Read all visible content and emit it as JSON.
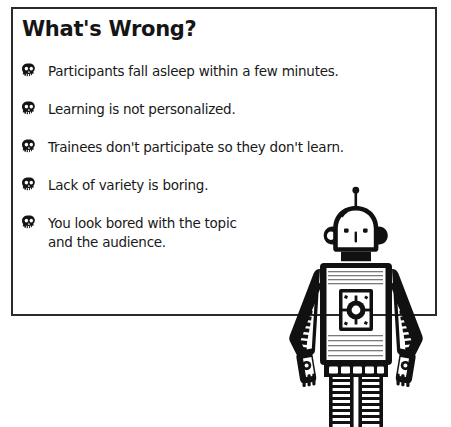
{
  "panel": {
    "title": "What's Wrong?",
    "border_color": "#2b2b2b",
    "background_color": "#ffffff"
  },
  "list": {
    "bullet_icon": "skull-icon",
    "items": [
      {
        "text": "Participants fall asleep within a few minutes."
      },
      {
        "text": "Learning is not personalized."
      },
      {
        "text": "Trainees don't participate so they don't learn."
      },
      {
        "text": "Lack of variety is boring."
      },
      {
        "text": "You look bored with the topic\nand the audience."
      }
    ]
  },
  "illustration": {
    "name": "robot-illustration",
    "description": "Line-art robot standing with arms at sides",
    "ink_color": "#111111"
  }
}
